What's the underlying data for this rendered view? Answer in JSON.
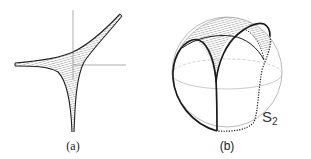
{
  "figure": {
    "panels": [
      {
        "id": "a",
        "label": "(a)",
        "description": "Shaded cusped region (astroid-like) with three spikes, drawn over coordinate axes"
      },
      {
        "id": "b",
        "label": "(b)",
        "description": "Sphere with hatched cap bounded by solid and dotted curves meeting at a cusp"
      }
    ],
    "sphere_label": "S",
    "sphere_label_subscript": "2",
    "colors": {
      "stroke": "#222222",
      "axis": "#888888",
      "hatch": "#777777",
      "sphere_outline": "#aaaaaa",
      "equator": "#bbbbbb"
    }
  }
}
